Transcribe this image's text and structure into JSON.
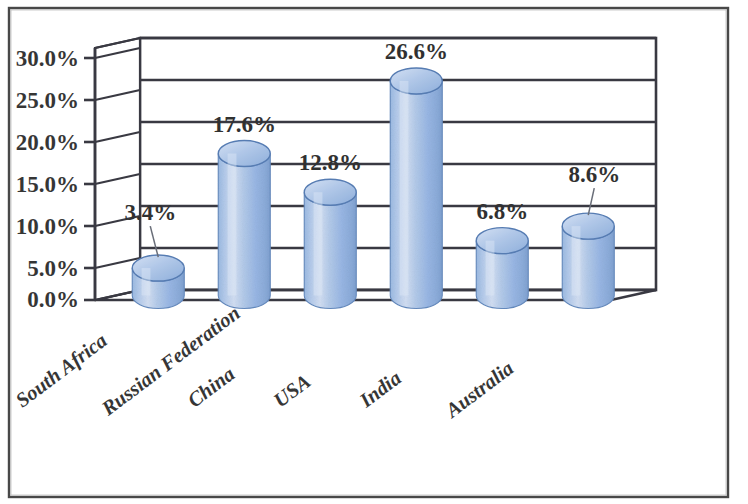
{
  "chart_data": {
    "type": "bar",
    "title": "",
    "subtitle": "",
    "xlabel": "",
    "ylabel": "",
    "categories": [
      "South Africa",
      "Russian Federation",
      "China",
      "USA",
      "India",
      "Australia"
    ],
    "values": [
      3.4,
      17.6,
      12.8,
      26.6,
      6.8,
      8.6
    ],
    "value_labels": [
      "3.4%",
      "17.6%",
      "12.8%",
      "26.6%",
      "6.8%",
      "8.6%"
    ],
    "ylim": [
      0,
      30
    ],
    "ytick_values": [
      0,
      5,
      10,
      15,
      20,
      25,
      30
    ],
    "ytick_labels": [
      "0.0%",
      "5.0%",
      "10.0%",
      "15.0%",
      "20.0%",
      "25.0%",
      "30.0%"
    ],
    "grid": true,
    "grid_axis": "y",
    "legend": false,
    "legend_position": "none",
    "style": "3d-cylinder",
    "series": [
      {
        "name": "Share",
        "values": [
          3.4,
          17.6,
          12.8,
          26.6,
          6.8,
          8.6
        ]
      }
    ],
    "colors": {
      "bar_fill_light": "#c3d4ee",
      "bar_fill_mid": "#8fb0df",
      "bar_fill_dark": "#6e92c8",
      "bar_top_fill": "#aac4e6",
      "outline": "#1e1e28",
      "text": "#1a1a1a",
      "background": "#ffffff"
    },
    "leader_lines": [
      {
        "category": "South Africa",
        "label": "3.4%"
      },
      {
        "category": "Australia",
        "label": "8.6%"
      }
    ]
  },
  "frame": {
    "border_color": "#2a2a2a",
    "has_outer_border": true
  }
}
